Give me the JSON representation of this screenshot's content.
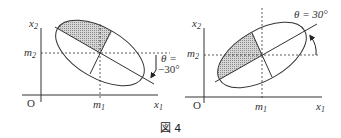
{
  "figure": {
    "caption": "図 4",
    "left_panel": {
      "y_axis_label": "x",
      "y_axis_sub": "2",
      "x_axis_label": "x",
      "x_axis_sub": "1",
      "origin_label": "O",
      "mean_x_label": "m",
      "mean_x_sub": "1",
      "mean_y_label": "m",
      "mean_y_sub": "2",
      "angle_label": "θ =",
      "angle_value": "−30°",
      "rotation_direction": "clockwise"
    },
    "right_panel": {
      "y_axis_label": "x",
      "y_axis_sub": "2",
      "x_axis_label": "x",
      "x_axis_sub": "1",
      "origin_label": "O",
      "mean_x_label": "m",
      "mean_x_sub": "1",
      "mean_y_label": "m",
      "mean_y_sub": "2",
      "angle_label": "θ = 30°",
      "rotation_direction": "counterclockwise"
    },
    "colors": {
      "line": "#333333",
      "shade": "#bdbdbd",
      "background": "#ffffff"
    }
  }
}
